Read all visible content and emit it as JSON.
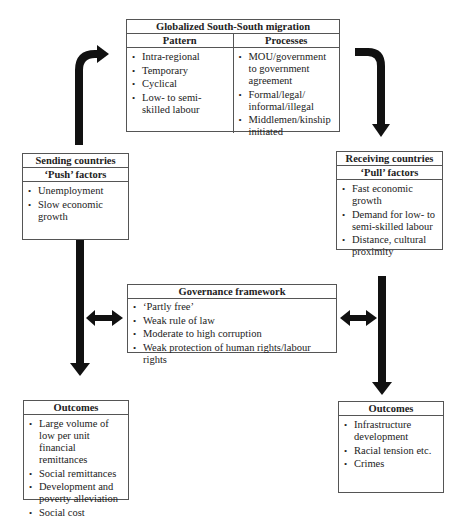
{
  "top_box": {
    "title": "Globalized South-South migration",
    "pattern": {
      "header": "Pattern",
      "items": [
        "Intra-regional",
        "Temporary",
        "Cyclical",
        "Low- to semi-skilled labour"
      ]
    },
    "processes": {
      "header": "Processes",
      "items": [
        "MOU/government to government agreement",
        "Formal/legal/ informal/illegal",
        "Middlemen/kinship initiated"
      ]
    }
  },
  "sending": {
    "title": "Sending countries",
    "subtitle": "‘Push’ factors",
    "items": [
      "Unemployment",
      "Slow economic growth"
    ]
  },
  "receiving": {
    "title": "Receiving countries",
    "subtitle": "‘Pull’ factors",
    "items": [
      "Fast economic growth",
      "Demand for low- to semi-skilled labour",
      "Distance, cultural proximity"
    ]
  },
  "governance": {
    "title": "Governance framework",
    "items": [
      "‘Partly free’",
      "Weak rule of law",
      "Moderate to high corruption",
      "Weak protection of human rights/labour rights"
    ]
  },
  "outcomes_left": {
    "title": "Outcomes",
    "items": [
      "Large volume of low per unit financial remittances",
      "Social remittances",
      "Development and poverty alleviation",
      "Social cost"
    ]
  },
  "outcomes_right": {
    "title": "Outcomes",
    "items": [
      "Infrastructure development",
      "Racial tension etc.",
      "Crimes"
    ]
  },
  "colors": {
    "arrow": "#111111",
    "border": "#555555"
  }
}
